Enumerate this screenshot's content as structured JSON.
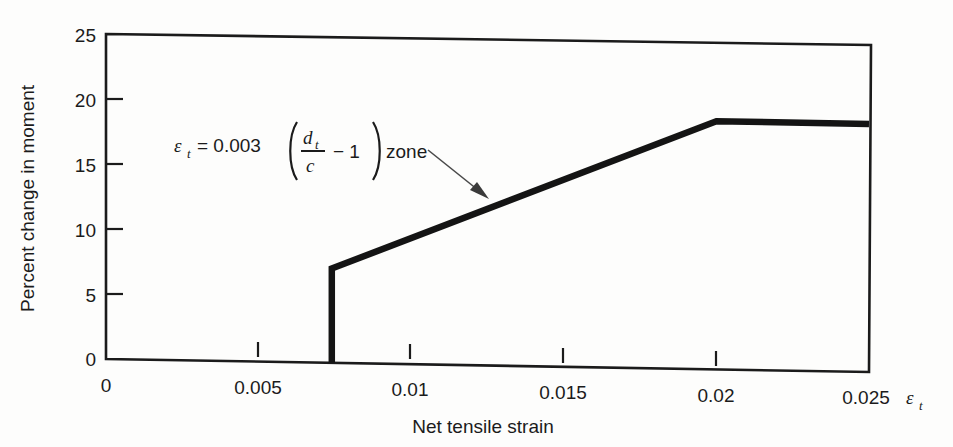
{
  "chart_data": {
    "type": "line",
    "title": "",
    "xlabel": "Net tensile strain",
    "ylabel": "Percent change in moment",
    "x_axis_symbol": "ε",
    "x_axis_symbol_sub": "t",
    "xlim": [
      0,
      0.025
    ],
    "ylim": [
      0,
      25
    ],
    "xticks": [
      0,
      0.005,
      0.01,
      0.015,
      0.02,
      0.025
    ],
    "xtick_labels": [
      "0",
      "0.005",
      "0.01",
      "0.015",
      "0.02",
      "0.025"
    ],
    "yticks": [
      0,
      5,
      10,
      15,
      20,
      25
    ],
    "ytick_labels": [
      "0",
      "5",
      "10",
      "15",
      "20",
      "25"
    ],
    "grid": false,
    "legend": false,
    "series": [
      {
        "name": "Percent change in moment",
        "points": [
          {
            "x": 0.0074,
            "y": 0
          },
          {
            "x": 0.0074,
            "y": 7.3
          },
          {
            "x": 0.02,
            "y": 19.2
          },
          {
            "x": 0.025,
            "y": 19.2
          }
        ]
      }
    ],
    "annotations": [
      {
        "name": "epsilon-t-zone-label",
        "text_parts": {
          "eps": "ε",
          "eps_sub": "t",
          "equals": "= 0.003",
          "paren_open": "(",
          "numerator": "d",
          "numerator_sub": "t",
          "denominator": "c",
          "minus_one": "− 1",
          "paren_close": ")",
          "zone": "zone"
        },
        "plain_text": "εt = 0.003 (dt/c − 1) zone",
        "x": 0.0035,
        "y": 16.6,
        "arrow_to": {
          "x": 0.0125,
          "y": 12.3
        }
      }
    ],
    "line_color": "#141414",
    "axis_color": "#1b1b1b"
  },
  "figure": {
    "background_color": "#fdfdfc"
  }
}
